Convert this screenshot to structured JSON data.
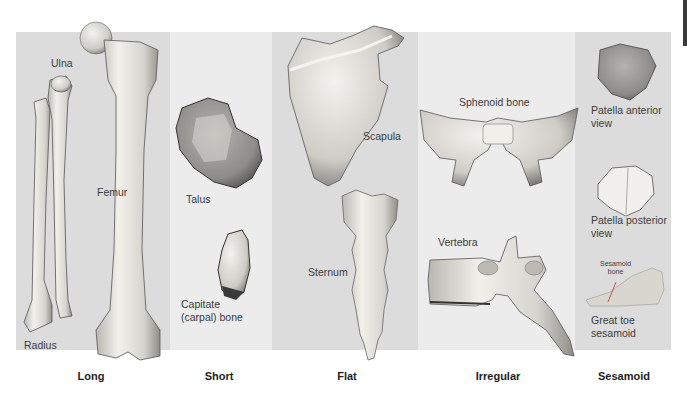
{
  "figure": {
    "categories": [
      {
        "name": "Long",
        "bones": [
          "Ulna",
          "Radius",
          "Femur"
        ]
      },
      {
        "name": "Short",
        "bones": [
          "Talus",
          "Capitate (carpal) bone"
        ]
      },
      {
        "name": "Flat",
        "bones": [
          "Scapula",
          "Sternum"
        ]
      },
      {
        "name": "Irregular",
        "bones": [
          "Sphenoid bone",
          "Vertebra"
        ]
      },
      {
        "name": "Sesamoid",
        "bones": [
          "Patella anterior view",
          "Patella posterior view",
          "Great toe sesamoid"
        ]
      }
    ]
  },
  "labels": {
    "ulna": "Ulna",
    "radius": "Radius",
    "femur": "Femur",
    "talus": "Talus",
    "capitate_1": "Capitate",
    "capitate_2": "(carpal) bone",
    "scapula": "Scapula",
    "sternum": "Sternum",
    "sphenoid": "Sphenoid bone",
    "vertebra": "Vertebra",
    "patella_ant_1": "Patella anterior",
    "patella_ant_2": "view",
    "patella_post_1": "Patella posterior",
    "patella_post_2": "view",
    "sesamoid_callout_1": "Sesamoid",
    "sesamoid_callout_2": "bone",
    "great_toe_1": "Great toe",
    "great_toe_2": "sesamoid"
  },
  "category_labels": {
    "long": "Long",
    "short": "Short",
    "flat": "Flat",
    "irregular": "Irregular",
    "sesamoid": "Sesamoid"
  },
  "colors": {
    "panel_dark": "#dcdcdc",
    "panel_light": "#ececec",
    "bone_fill": "#e8e6e1",
    "bone_shadow": "#8a8a8a"
  }
}
